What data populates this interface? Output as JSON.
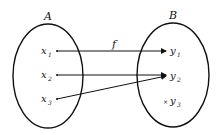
{
  "diagram": {
    "type": "function-mapping",
    "sets": [
      {
        "label": "A",
        "elements": [
          {
            "name": "x",
            "sub": "1"
          },
          {
            "name": "x",
            "sub": "2"
          },
          {
            "name": "x",
            "sub": "3"
          }
        ]
      },
      {
        "label": "B",
        "elements": [
          {
            "name": "y",
            "sub": "1"
          },
          {
            "name": "y",
            "sub": "2"
          },
          {
            "name": "y",
            "sub": "3"
          }
        ]
      }
    ],
    "function_label": "f",
    "mappings": [
      {
        "from": "x1",
        "to": "y1"
      },
      {
        "from": "x2",
        "to": "y2"
      },
      {
        "from": "x3",
        "to": "y2"
      }
    ],
    "stroke_color": "#111111"
  }
}
